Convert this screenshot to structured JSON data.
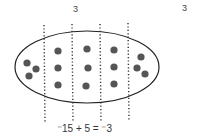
{
  "labels": {
    "top_left": "3",
    "top_right": "3"
  },
  "equation": {
    "text": "⁻15 + 5 = ⁻3"
  },
  "diagram": {
    "total_counters": 15,
    "groups": 5,
    "per_group": 3,
    "colors": {
      "counter": "#555555",
      "ellipse_stroke": "#222222",
      "divider": "#333333"
    }
  }
}
